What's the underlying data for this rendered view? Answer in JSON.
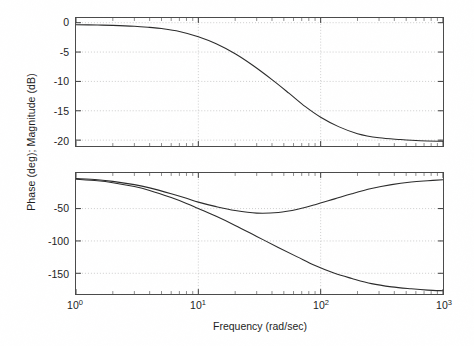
{
  "figure": {
    "title": "",
    "background_color": "#ffffff",
    "axis_color": "#4a4a4a",
    "grid_color": "#bfbfbf",
    "curve_color": "#2b2b2b"
  },
  "labels": {
    "ylabel": "Phase (deg); Magnitude (dB)",
    "xlabel": "Frequency (rad/sec)"
  },
  "xticks": [
    {
      "base": "10",
      "exp": "0",
      "value": 1
    },
    {
      "base": "10",
      "exp": "1",
      "value": 10
    },
    {
      "base": "10",
      "exp": "2",
      "value": 100
    },
    {
      "base": "10",
      "exp": "3",
      "value": 1000
    }
  ],
  "magnitude_yticks": [
    "0",
    "-5",
    "-10",
    "-15",
    "-20"
  ],
  "phase_yticks": [
    "-50",
    "-100",
    "-150"
  ],
  "chart_data": [
    {
      "type": "line",
      "title": "Magnitude",
      "xlabel": "Frequency (rad/sec)",
      "ylabel": "Magnitude (dB)",
      "xscale": "log",
      "xlim": [
        1,
        1000
      ],
      "ylim": [
        -21,
        0.8
      ],
      "yticks": [
        0,
        -5,
        -10,
        -15,
        -20
      ],
      "xticks": [
        1,
        10,
        100,
        1000
      ],
      "grid": true,
      "legend": "none",
      "series": [
        {
          "name": "Magnitude (dB)",
          "color": "#2b2b2b",
          "x": [
            1,
            1.5,
            2,
            3,
            4,
            5,
            7,
            10,
            14,
            20,
            28,
            40,
            55,
            75,
            100,
            140,
            200,
            300,
            450,
            650,
            1000
          ],
          "y": [
            -0.35,
            -0.4,
            -0.45,
            -0.6,
            -0.8,
            -1.0,
            -1.5,
            -2.4,
            -3.6,
            -5.3,
            -7.3,
            -9.7,
            -12.0,
            -14.3,
            -16.1,
            -17.7,
            -18.9,
            -19.6,
            -19.9,
            -20.1,
            -20.2
          ]
        }
      ]
    },
    {
      "type": "line",
      "title": "Phase",
      "xlabel": "Frequency (rad/sec)",
      "ylabel": "Phase (deg)",
      "xscale": "log",
      "xlim": [
        1,
        1000
      ],
      "ylim": [
        -182,
        5
      ],
      "yticks": [
        -50,
        -100,
        -150
      ],
      "xticks": [
        1,
        10,
        100,
        1000
      ],
      "grid": true,
      "legend": "none",
      "series": [
        {
          "name": "Phase - resonant branch",
          "color": "#2b2b2b",
          "x": [
            1,
            1.5,
            2,
            3,
            4,
            6,
            8,
            10,
            14,
            20,
            30,
            45,
            65,
            90,
            130,
            180,
            260,
            380,
            550,
            750,
            1000
          ],
          "y": [
            -3.5,
            -5.5,
            -8,
            -13,
            -18,
            -27,
            -34,
            -40,
            -47,
            -53,
            -57,
            -56,
            -51,
            -44,
            -35,
            -27,
            -19,
            -13,
            -9,
            -7,
            -5.5
          ]
        },
        {
          "name": "Phase - rolloff branch",
          "color": "#2b2b2b",
          "x": [
            1,
            1.5,
            2,
            3,
            4,
            6,
            8,
            10,
            14,
            20,
            30,
            45,
            65,
            90,
            130,
            180,
            260,
            380,
            550,
            750,
            1000
          ],
          "y": [
            -4.5,
            -7,
            -10,
            -16,
            -22,
            -33,
            -42,
            -50,
            -62,
            -76,
            -93,
            -110,
            -125,
            -138,
            -150,
            -158,
            -166,
            -171,
            -174,
            -176,
            -177
          ]
        }
      ]
    }
  ]
}
